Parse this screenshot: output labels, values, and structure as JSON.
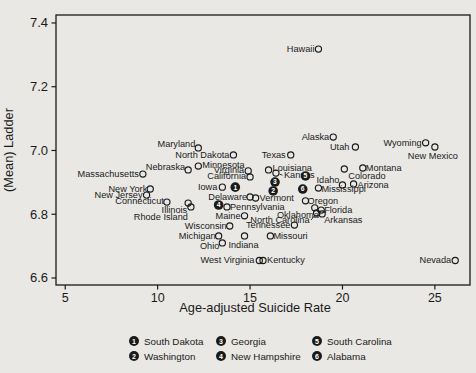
{
  "figure_title": "Scatter plot of state mean Cantril ladder versus age-adjusted suicide rate",
  "colors": {
    "background": "#e9e8e4",
    "ink": "#1a1a1a"
  },
  "chart_data": {
    "type": "scatter",
    "title": "",
    "xlabel": "Age-adjusted Suicide Rate",
    "ylabel": "(Mean) Ladder",
    "x_axis": {
      "min": 4.5,
      "max": 26.9,
      "ticks": [
        5,
        10,
        15,
        20,
        25
      ],
      "tick_labels": [
        "5",
        "10",
        "15",
        "20",
        "25"
      ]
    },
    "y_axis": {
      "min": 6.578,
      "max": 7.425,
      "ticks": [
        6.6,
        6.8,
        7.0,
        7.2,
        7.4
      ],
      "tick_labels": [
        "6.6",
        "6.8",
        "7.0",
        "7.2",
        "7.4"
      ]
    },
    "grid": false,
    "marker": "open-circle",
    "points": [
      {
        "label": "Hawaii",
        "x": 18.7,
        "y": 7.318,
        "a": "e",
        "dx": -4,
        "dy": 3
      },
      {
        "label": "Alaska",
        "x": 19.5,
        "y": 7.042,
        "a": "e",
        "dx": -4,
        "dy": 3
      },
      {
        "label": "Utah",
        "x": 20.7,
        "y": 7.011,
        "a": "e",
        "dx": -6,
        "dy": 3
      },
      {
        "label": "Wyoming",
        "x": 24.5,
        "y": 7.024,
        "a": "e",
        "dx": -4,
        "dy": 3
      },
      {
        "label": "New Mexico",
        "x": 25.0,
        "y": 7.011,
        "a": "m",
        "dx": -2,
        "dy": 12
      },
      {
        "label": "Maryland",
        "x": 12.2,
        "y": 7.008,
        "a": "e",
        "dx": -3,
        "dy": -1
      },
      {
        "label": "North Dakota",
        "x": 14.1,
        "y": 6.986,
        "a": "e",
        "dx": -4,
        "dy": 3
      },
      {
        "label": "Texas",
        "x": 17.2,
        "y": 6.986,
        "a": "e",
        "dx": -5,
        "dy": 3
      },
      {
        "label": "Minnesota",
        "x": 12.2,
        "y": 6.951,
        "a": "s",
        "dx": 4,
        "dy": 2
      },
      {
        "label": "Nebraska",
        "x": 11.65,
        "y": 6.939,
        "a": "e",
        "dx": -3,
        "dy": 0
      },
      {
        "label": "Montana",
        "x": 21.1,
        "y": 6.945,
        "a": "s",
        "dx": 3,
        "dy": 3
      },
      {
        "label": "Colorado",
        "x": 20.1,
        "y": 6.942,
        "a": "s",
        "dx": 4,
        "dy": 10
      },
      {
        "label": "Massachusetts",
        "x": 9.2,
        "y": 6.926,
        "a": "e",
        "dx": -4,
        "dy": 3
      },
      {
        "label": "Virginia",
        "x": 14.9,
        "y": 6.936,
        "a": "e",
        "dx": -4,
        "dy": 2
      },
      {
        "label": "Louisiana",
        "x": 16.0,
        "y": 6.939,
        "a": "s",
        "dx": 4,
        "dy": 1
      },
      {
        "label": "Kansas",
        "x": 16.4,
        "y": 6.929,
        "a": "s",
        "dx": 8,
        "dy": 5,
        "leader": true
      },
      {
        "label": "California",
        "x": 15.0,
        "y": 6.917,
        "a": "e",
        "dx": -4,
        "dy": 2
      },
      {
        "label": "Iowa",
        "x": 13.5,
        "y": 6.885,
        "a": "e",
        "dx": -5,
        "dy": 3
      },
      {
        "label": "South Dakota",
        "x": 14.2,
        "y": 6.885,
        "m": 1
      },
      {
        "label": "Georgia",
        "x": 16.35,
        "y": 6.901,
        "m": 3
      },
      {
        "label": "Washington",
        "x": 16.25,
        "y": 6.873,
        "m": 2
      },
      {
        "label": "South Carolina",
        "x": 18.0,
        "y": 6.92,
        "m": 5
      },
      {
        "label": "Alabama",
        "x": 17.85,
        "y": 6.879,
        "m": 6
      },
      {
        "label": "Mississippi",
        "x": 18.7,
        "y": 6.882,
        "a": "s",
        "dx": 3,
        "dy": 4
      },
      {
        "label": "Idaho",
        "x": 20.0,
        "y": 6.892,
        "a": "e",
        "dx": -3,
        "dy": -2
      },
      {
        "label": "Arizona",
        "x": 20.6,
        "y": 6.895,
        "a": "s",
        "dx": 4,
        "dy": 4
      },
      {
        "label": "New York",
        "x": 9.6,
        "y": 6.879,
        "a": "e",
        "dx": -3,
        "dy": 3
      },
      {
        "label": "New Jersey",
        "x": 9.4,
        "y": 6.86,
        "a": "e",
        "dx": -4,
        "dy": 3
      },
      {
        "label": "Connecticut",
        "x": 10.5,
        "y": 6.838,
        "a": "e",
        "dx": -3,
        "dy": 2
      },
      {
        "label": "Illinois",
        "x": 11.65,
        "y": 6.835,
        "a": "e",
        "dx": -1,
        "dy": 10
      },
      {
        "label": "Rhode Island",
        "x": 11.8,
        "y": 6.823,
        "a": "e",
        "dx": -3,
        "dy": 13
      },
      {
        "label": "Delaware",
        "x": 15.0,
        "y": 6.854,
        "a": "e",
        "dx": -3,
        "dy": 3
      },
      {
        "label": "Vermont",
        "x": 15.3,
        "y": 6.851,
        "a": "s",
        "dx": 4,
        "dy": 3
      },
      {
        "label": "New Hampshire",
        "x": 13.3,
        "y": 6.829,
        "m": 4
      },
      {
        "label": "Pennsylvania",
        "x": 13.75,
        "y": 6.823,
        "a": "s",
        "dx": 3,
        "dy": 3
      },
      {
        "label": "Maine",
        "x": 14.7,
        "y": 6.795,
        "a": "e",
        "dx": -4,
        "dy": 3
      },
      {
        "label": "Oregon",
        "x": 18.0,
        "y": 6.842,
        "a": "s",
        "dx": 2,
        "dy": 3
      },
      {
        "label": "Oklahoma",
        "x": 18.5,
        "y": 6.82,
        "a": "e",
        "dx": 4,
        "dy": 10,
        "leader": true
      },
      {
        "label": "Florida",
        "x": 18.85,
        "y": 6.813,
        "a": "s",
        "dx": 3,
        "dy": 3
      },
      {
        "label": "North Carolina",
        "x": 18.6,
        "y": 6.804,
        "a": "e",
        "dx": -7,
        "dy": 10,
        "leader": true
      },
      {
        "label": "Arkansas",
        "x": 18.9,
        "y": 6.801,
        "a": "s",
        "dx": 2,
        "dy": 9
      },
      {
        "label": "Wisconsin",
        "x": 13.9,
        "y": 6.763,
        "a": "e",
        "dx": -3,
        "dy": 3
      },
      {
        "label": "Tennessee",
        "x": 17.4,
        "y": 6.766,
        "a": "e",
        "dx": -4,
        "dy": 3
      },
      {
        "label": "Michigan",
        "x": 13.3,
        "y": 6.732,
        "a": "e",
        "dx": -3,
        "dy": 3
      },
      {
        "label": "Indiana",
        "x": 14.7,
        "y": 6.732,
        "a": "m",
        "dx": -1,
        "dy": 12
      },
      {
        "label": "Missouri",
        "x": 16.1,
        "y": 6.732,
        "a": "s",
        "dx": 3,
        "dy": 3
      },
      {
        "label": "Ohio",
        "x": 13.5,
        "y": 6.71,
        "a": "e",
        "dx": -3,
        "dy": 6
      },
      {
        "label": "West Virginia",
        "x": 15.5,
        "y": 6.655,
        "a": "e",
        "dx": -5,
        "dy": 3
      },
      {
        "label": "Kentucky",
        "x": 15.7,
        "y": 6.655,
        "a": "s",
        "dx": 4,
        "dy": 3
      },
      {
        "label": "Nevada",
        "x": 26.1,
        "y": 6.655,
        "a": "e",
        "dx": -4,
        "dy": 3
      }
    ],
    "legend": {
      "position": "bottom",
      "items": [
        {
          "n": "1",
          "label": "South Dakota",
          "col": 0,
          "row": 0
        },
        {
          "n": "2",
          "label": "Washington",
          "col": 0,
          "row": 1
        },
        {
          "n": "3",
          "label": "Georgia",
          "col": 1,
          "row": 0
        },
        {
          "n": "4",
          "label": "New Hampshire",
          "col": 1,
          "row": 1
        },
        {
          "n": "5",
          "label": "South Carolina",
          "col": 2,
          "row": 0
        },
        {
          "n": "6",
          "label": "Alabama",
          "col": 2,
          "row": 1
        }
      ]
    }
  }
}
